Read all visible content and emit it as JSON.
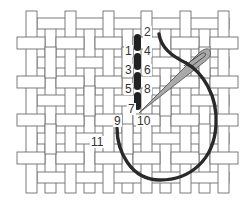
{
  "diagram": {
    "title": "",
    "colors": {
      "canvas_fill": "#ffffff",
      "canvas_outline": "#6e6e6e",
      "stitch": "#222222",
      "thread": "#2a2a2a",
      "needle_fill": "#a9a9a9",
      "needle_outline": "#5a5a5a"
    },
    "labels": [
      {
        "id": "1",
        "text": "1",
        "x": 124,
        "y": 45
      },
      {
        "id": "2",
        "text": "2",
        "x": 143,
        "y": 26
      },
      {
        "id": "3",
        "text": "3",
        "x": 124,
        "y": 64
      },
      {
        "id": "4",
        "text": "4",
        "x": 143,
        "y": 45
      },
      {
        "id": "5",
        "text": "5",
        "x": 124,
        "y": 83
      },
      {
        "id": "6",
        "text": "6",
        "x": 143,
        "y": 64
      },
      {
        "id": "7",
        "text": "7",
        "x": 128,
        "y": 102
      },
      {
        "id": "8",
        "text": "8",
        "x": 143,
        "y": 83
      },
      {
        "id": "9",
        "text": "9",
        "x": 113,
        "y": 114
      },
      {
        "id": "10",
        "text": "10",
        "x": 137,
        "y": 114
      },
      {
        "id": "11",
        "text": "11",
        "x": 90,
        "y": 135
      }
    ],
    "stitches": [
      {
        "from": "1",
        "to": "2"
      },
      {
        "from": "3",
        "to": "4"
      },
      {
        "from": "5",
        "to": "6"
      },
      {
        "from": "7",
        "to": "8"
      }
    ],
    "icons": {
      "needle": "needle-icon",
      "thread": "thread-icon"
    }
  }
}
